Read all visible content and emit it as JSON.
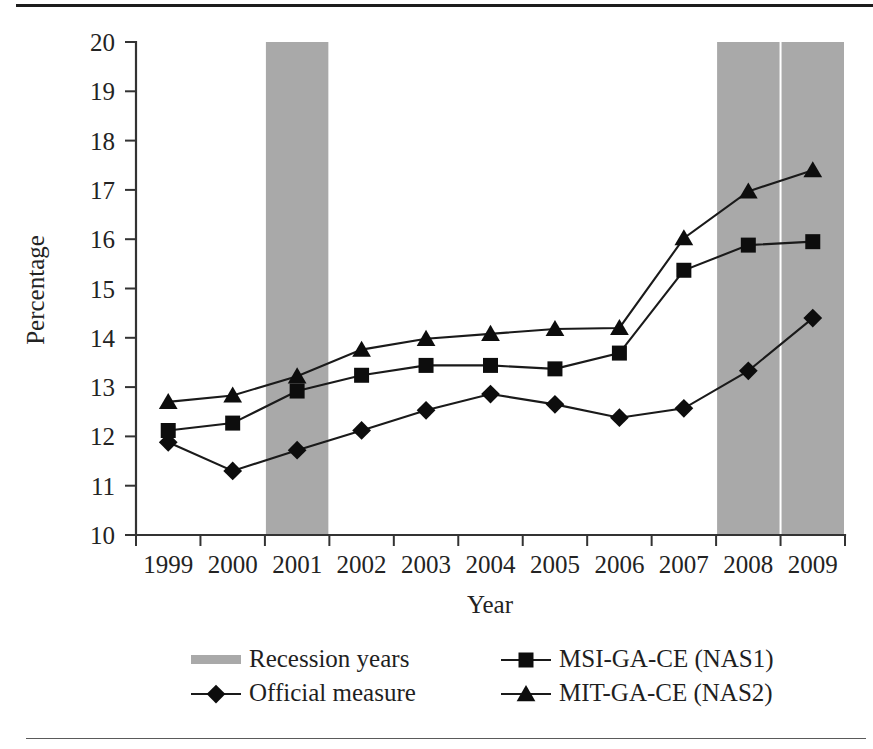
{
  "figure": {
    "title": "",
    "axis_color": "#333333",
    "series_color": "#0d0d0d",
    "recession_color": "#a9a9a9",
    "background": "#ffffff"
  },
  "chart_data": {
    "type": "line",
    "title": "",
    "subtitle": "",
    "xlabel": "Year",
    "ylabel": "Percentage",
    "categories": [
      "1999",
      "2000",
      "2001",
      "2002",
      "2003",
      "2004",
      "2005",
      "2006",
      "2007",
      "2008",
      "2009"
    ],
    "x": [
      1999,
      2000,
      2001,
      2002,
      2003,
      2004,
      2005,
      2006,
      2007,
      2008,
      2009
    ],
    "ylim": [
      10,
      20
    ],
    "xlim_categories": [
      "1999",
      "2009"
    ],
    "yticks": [
      10,
      11,
      12,
      13,
      14,
      15,
      16,
      17,
      18,
      19,
      20
    ],
    "ytick_labels": [
      "10",
      "11",
      "12",
      "13",
      "14",
      "15",
      "16",
      "17",
      "18",
      "19",
      "20"
    ],
    "xticks_at_category_boundaries": true,
    "grid": false,
    "legend_position": "below-axes",
    "series": [
      {
        "name": "Official measure",
        "marker": "diamond",
        "values": [
          11.88,
          11.3,
          11.72,
          12.12,
          12.53,
          12.86,
          12.65,
          12.38,
          12.57,
          13.33,
          14.4
        ]
      },
      {
        "name": "MSI-GA-CE (NAS1)",
        "marker": "square",
        "values": [
          12.12,
          12.27,
          12.92,
          13.24,
          13.44,
          13.44,
          13.37,
          13.69,
          15.37,
          15.88,
          15.95
        ]
      },
      {
        "name": "MIT-GA-CE (NAS2)",
        "marker": "triangle",
        "values": [
          12.7,
          12.83,
          13.22,
          13.76,
          13.98,
          14.08,
          14.18,
          14.2,
          16.02,
          16.97,
          17.4
        ]
      }
    ],
    "shaded_regions": [
      {
        "name": "Recession years",
        "category": "2001",
        "color": "#a9a9a9"
      },
      {
        "name": "Recession years",
        "category": "2008",
        "color": "#a9a9a9"
      },
      {
        "name": "Recession years",
        "category": "2009",
        "color": "#a9a9a9"
      }
    ],
    "annotations": []
  },
  "legend": {
    "entries": [
      {
        "label": "Recession years",
        "marker": "band",
        "column": 0,
        "row": 0
      },
      {
        "label": "Official measure",
        "marker": "diamond",
        "column": 0,
        "row": 1
      },
      {
        "label": "MSI-GA-CE (NAS1)",
        "marker": "square",
        "column": 1,
        "row": 0
      },
      {
        "label": "MIT-GA-CE (NAS2)",
        "marker": "triangle",
        "column": 1,
        "row": 1
      }
    ]
  }
}
